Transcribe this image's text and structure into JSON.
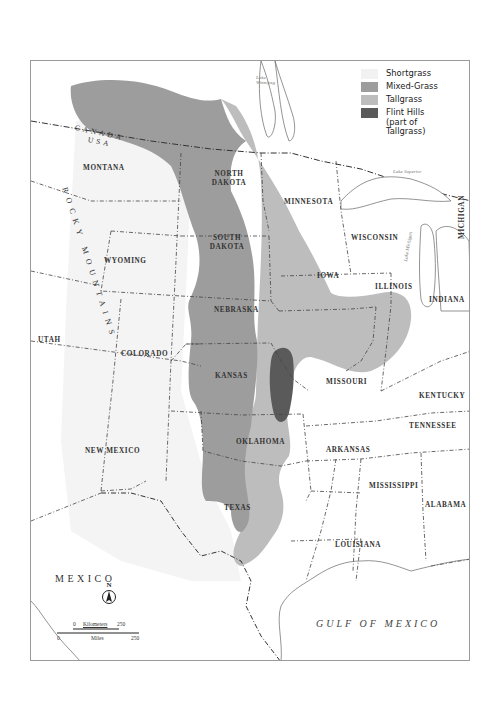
{
  "map": {
    "colors": {
      "shortgrass": "#f2f2f2",
      "mixed_grass": "#9d9d9d",
      "tallgrass": "#bdbdbd",
      "flint_hills": "#5a5a5a",
      "border": "#9a9a9a",
      "text": "#333333"
    },
    "legend": [
      {
        "label": "Shortgrass",
        "color": "#f2f2f2"
      },
      {
        "label": "Mixed-Grass",
        "color": "#9d9d9d"
      },
      {
        "label": "Tallgrass",
        "color": "#bdbdbd"
      },
      {
        "label": "Flint Hills",
        "sublabel": "(part of Tallgrass)",
        "color": "#5a5a5a"
      }
    ],
    "countries": {
      "canada": "CANADA",
      "usa": "USA",
      "mexico": "MEXICO"
    },
    "mountains": "ROCKY MOUNTAINS",
    "water_bodies": {
      "lake_winnipeg_1": "Lake",
      "lake_winnipeg_2": "Winnipeg",
      "lake_superior": "Lake Superior",
      "lake_michigan": "Lake Michigan",
      "gulf": "GULF OF MEXICO"
    },
    "states": {
      "montana": "MONTANA",
      "north_dakota_1": "NORTH",
      "north_dakota_2": "DAKOTA",
      "minnesota": "MINNESOTA",
      "wisconsin": "WISCONSIN",
      "michigan": "MICHIGAN",
      "south_dakota_1": "SOUTH",
      "south_dakota_2": "DAKOTA",
      "wyoming": "WYOMING",
      "nebraska": "NEBRASKA",
      "iowa": "IOWA",
      "illinois": "ILLINOIS",
      "indiana": "INDIANA",
      "utah": "UTAH",
      "colorado": "COLORADO",
      "kansas": "KANSAS",
      "missouri": "MISSOURI",
      "kentucky": "KENTUCKY",
      "tennessee": "TENNESSEE",
      "new_mexico": "NEW MEXICO",
      "oklahoma": "OKLAHOMA",
      "arkansas": "ARKANSAS",
      "mississippi": "MISSISSIPPI",
      "alabama": "ALABAMA",
      "texas": "TEXAS",
      "louisiana": "LOUISIANA"
    },
    "compass": {
      "label": "N"
    },
    "scale_bar": {
      "km_zero": "0",
      "km_label": "Kilometers",
      "km_max": "250",
      "mi_zero": "0",
      "mi_label": "Miles",
      "mi_max": "250"
    }
  }
}
